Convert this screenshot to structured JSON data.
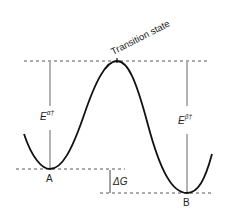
{
  "diagram": {
    "labels": {
      "transition_state": "Transition state",
      "state_a": "A",
      "state_b": "B",
      "delta_g": "ΔG",
      "e_alpha": "E",
      "e_alpha_sup": "α†",
      "e_beta": "E",
      "e_beta_sup": "β†"
    },
    "colors": {
      "curve": "#111111",
      "dashed": "#555555",
      "bar": "#666666"
    }
  }
}
